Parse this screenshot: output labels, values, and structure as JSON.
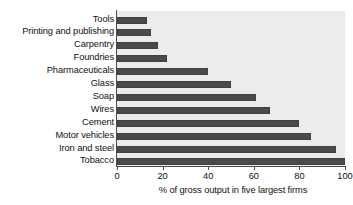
{
  "chart_data": {
    "type": "bar",
    "orientation": "horizontal",
    "title": "",
    "xlabel": "% of gross output in five largest firms",
    "ylabel": "",
    "xlim": [
      0,
      100
    ],
    "xticks": [
      0,
      20,
      40,
      60,
      80,
      100
    ],
    "grid": false,
    "legend": null,
    "plot_background": "#ececec",
    "bar_color": "#4a4a4a",
    "axis_color": "#4d4d4d",
    "categories": [
      "Tools",
      "Printing and publishing",
      "Carpentry",
      "Foundries",
      "Pharmaceuticals",
      "Glass",
      "Soap",
      "Wires",
      "Cement",
      "Motor vehicles",
      "Iron and steel",
      "Tobacco"
    ],
    "values": [
      13,
      15,
      18,
      22,
      40,
      50,
      61,
      67,
      80,
      85,
      96,
      100
    ],
    "tick_labels": [
      "0",
      "20",
      "40",
      "60",
      "80",
      "100"
    ]
  }
}
